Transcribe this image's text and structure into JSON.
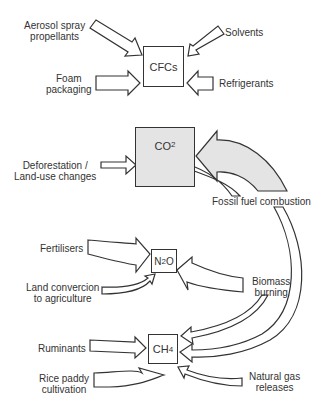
{
  "cfc": {
    "box": "CFCs",
    "sources": [
      "Aerosol spray propellants",
      "Solvents",
      "Foam packaging",
      "Refrigerants"
    ],
    "aerosol_l1": "Aerosol spray",
    "aerosol_l2": "propellants",
    "solvents": "Solvents",
    "foam_l1": "Foam",
    "foam_l2": "packaging",
    "refrigerants": "Refrigerants"
  },
  "co2": {
    "box_main": "CO",
    "box_sub": "2",
    "defor_l1": "Deforestation /",
    "defor_l2": "Land-use changes",
    "fossil": "Fossil fuel combustion",
    "fill_color": "#e4e4e4"
  },
  "n2o": {
    "box_a": "N",
    "box_sub": "2",
    "box_b": "O",
    "fertilisers": "Fertilisers",
    "land_l1": "Land convercion",
    "land_l2": "to agriculture",
    "biomass_l1": "Biomass",
    "biomass_l2": "burning"
  },
  "ch4": {
    "box_main": "CH",
    "box_sub": "4",
    "ruminants": "Ruminants",
    "rice_l1": "Rice paddy",
    "rice_l2": "cultivation",
    "gas_l1": "Natural gas",
    "gas_l2": "releases"
  }
}
